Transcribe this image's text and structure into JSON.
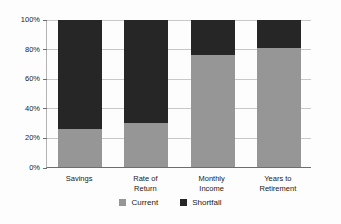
{
  "chart_data": {
    "type": "bar",
    "variant": "stacked-100-percent",
    "title": "",
    "subtitle": "",
    "xlabel": "",
    "ylabel": "",
    "ylim": [
      0,
      100
    ],
    "ytick_labels": [
      "0%",
      "20%",
      "40%",
      "60%",
      "80%",
      "100%"
    ],
    "ytick_values": [
      0,
      20,
      40,
      60,
      80,
      100
    ],
    "grid": true,
    "legend_position": "bottom-center",
    "categories": [
      "Savings",
      "Rate of Return",
      "Monthly Income",
      "Years to Retirement"
    ],
    "category_lines": [
      [
        "Savings"
      ],
      [
        "Rate of",
        "Return"
      ],
      [
        "Monthly",
        "Income"
      ],
      [
        "Years to",
        "Retirement"
      ]
    ],
    "series": [
      {
        "name": "Current",
        "color": "#969696",
        "values": [
          26,
          30,
          76,
          81
        ]
      },
      {
        "name": "Shortfall",
        "color": "#262626",
        "values": [
          74,
          70,
          24,
          19
        ]
      }
    ]
  },
  "colors": {
    "current": "#969696",
    "shortfall": "#262626",
    "gridline": "#c8c8c8",
    "axis": "#6e6e6e",
    "background": "#fdfdfd",
    "text": "#1a1a1a"
  },
  "legend": {
    "items": [
      {
        "label": "Current",
        "swatch": "legend-swatch-current"
      },
      {
        "label": "Shortfall",
        "swatch": "legend-swatch-shortfall"
      }
    ]
  }
}
